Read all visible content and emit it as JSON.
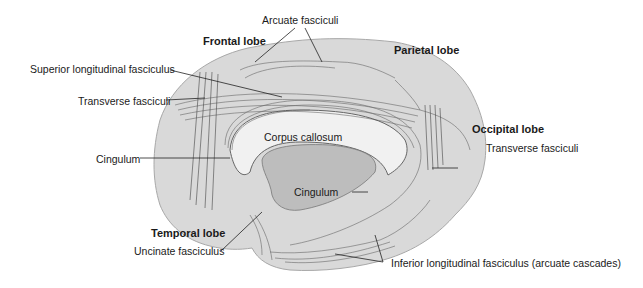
{
  "diagram": {
    "colors": {
      "cortex_fill": "#d9d9d9",
      "cortex_outline": "#a8a8a8",
      "callosum_fill": "#f1f1f1",
      "ventricle_fill": "#bdbdbd",
      "fiber_stroke": "#555555",
      "label_text": "#1a1a1a",
      "leader_line": "#222222"
    },
    "lobes": {
      "frontal": "Frontal lobe",
      "parietal": "Parietal lobe",
      "occipital": "Occipital lobe",
      "temporal": "Temporal lobe"
    },
    "labels": {
      "arcuate": "Arcuate fasciculi",
      "superior_longitudinal": "Superior longitudinal fasciculus",
      "transverse_left": "Transverse fasciculi",
      "transverse_right": "Transverse fasciculi",
      "corpus_callosum": "Corpus callosum",
      "cingulum_left": "Cingulum",
      "cingulum_center": "Cingulum",
      "uncinate": "Uncinate fasciculus",
      "inferior_longitudinal": "Inferior longitudinal fasciculus (arcuate cascades)"
    }
  }
}
